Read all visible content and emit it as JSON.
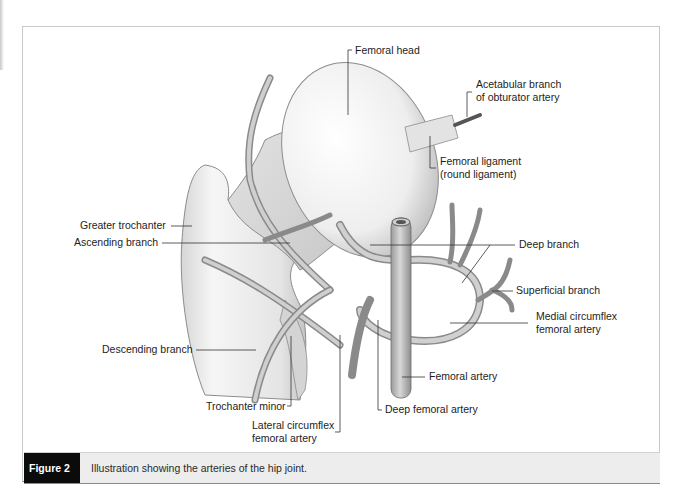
{
  "figure": {
    "label": "Figure 2",
    "caption": "Illustration showing the arteries of the hip joint."
  },
  "labels": {
    "femoral_head": "Femoral head",
    "acetabular_branch": [
      "Acetabular branch",
      "of obturator artery"
    ],
    "femoral_ligament": [
      "Femoral ligament",
      "(round ligament)"
    ],
    "greater_trochanter": "Greater trochanter",
    "ascending_branch": "Ascending branch",
    "deep_branch": "Deep branch",
    "superficial_branch": "Superficial branch",
    "medial_circumflex": [
      "Medial circumflex",
      "femoral artery"
    ],
    "descending_branch": "Descending branch",
    "femoral_artery": "Femoral artery",
    "trochanter_minor": "Trochanter minor",
    "deep_femoral_artery": "Deep femoral artery",
    "lateral_circumflex": [
      "Lateral circumflex",
      "femoral artery"
    ]
  },
  "colors": {
    "caption_label_bg": "#0b0b0b",
    "caption_bar_bg": "#ededed",
    "bone_fill": "#e9e9e9",
    "artery_fill": "#bdbdbd",
    "leader_line": "#333333"
  }
}
